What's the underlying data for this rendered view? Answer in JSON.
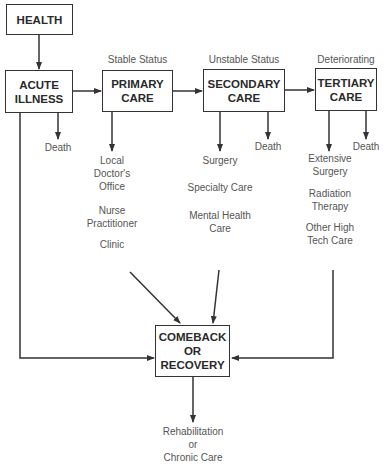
{
  "diagram": {
    "nodes": {
      "health": {
        "label": "HEALTH"
      },
      "acute": {
        "line1": "ACUTE",
        "line2": "ILLNESS"
      },
      "primary": {
        "line1": "PRIMARY",
        "line2": "CARE",
        "status": "Stable Status"
      },
      "secondary": {
        "line1": "SECONDARY",
        "line2": "CARE",
        "status": "Unstable Status"
      },
      "tertiary": {
        "line1": "TERTIARY",
        "line2": "CARE",
        "status": "Deteriorating"
      },
      "recovery": {
        "line1": "COMEBACK",
        "line2": "OR",
        "line3": "RECOVERY"
      }
    },
    "outcomes": {
      "acute_death": "Death",
      "secondary_death": "Death",
      "tertiary_death": "Death",
      "primary_services": [
        {
          "lines": [
            "Local",
            "Doctor's",
            "Office"
          ]
        },
        {
          "lines": [
            "Nurse",
            "Practitioner"
          ]
        },
        {
          "lines": [
            "Clinic"
          ]
        }
      ],
      "secondary_services": [
        {
          "lines": [
            "Surgery"
          ]
        },
        {
          "lines": [
            "Specialty Care"
          ]
        },
        {
          "lines": [
            "Mental Health",
            "Care"
          ]
        }
      ],
      "tertiary_services": [
        {
          "lines": [
            "Extensive",
            "Surgery"
          ]
        },
        {
          "lines": [
            "Radiation",
            "Therapy"
          ]
        },
        {
          "lines": [
            "Other High",
            "Tech Care"
          ]
        }
      ],
      "recovery_next": {
        "lines": [
          "Rehabilitation",
          "or",
          "Chronic Care"
        ]
      }
    }
  }
}
